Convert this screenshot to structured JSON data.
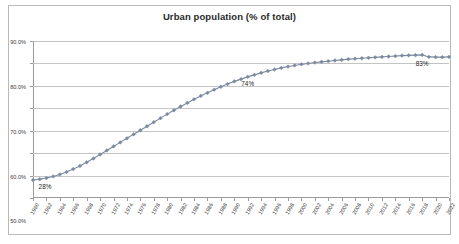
{
  "chart_data": {
    "type": "line",
    "title": "Urban population (% of total)",
    "xlabel": "",
    "ylabel": "",
    "ylim": [
      20,
      90
    ],
    "ytick_step": 10,
    "ytick_labels": [
      "20.0%",
      "30.0%",
      "40.0%",
      "50.0%",
      "60.0%",
      "70.0%",
      "80.0%",
      "90.0%"
    ],
    "ytick_values": [
      20,
      30,
      40,
      50,
      60,
      70,
      80,
      90
    ],
    "grid": "horizontal",
    "legend": "none",
    "marker": "diamond",
    "series_color": "#7b8aa0",
    "x": [
      1960,
      1961,
      1962,
      1963,
      1964,
      1965,
      1966,
      1967,
      1968,
      1969,
      1970,
      1971,
      1972,
      1973,
      1974,
      1975,
      1976,
      1977,
      1978,
      1979,
      1980,
      1981,
      1982,
      1983,
      1984,
      1985,
      1986,
      1987,
      1988,
      1989,
      1990,
      1991,
      1992,
      1993,
      1994,
      1995,
      1996,
      1997,
      1998,
      1999,
      2000,
      2001,
      2002,
      2003,
      2004,
      2005,
      2006,
      2007,
      2008,
      2009,
      2010,
      2011,
      2012,
      2013,
      2014,
      2015,
      2016,
      2017,
      2018,
      2019,
      2020,
      2021,
      2022
    ],
    "values": [
      28.0,
      28.4,
      28.9,
      29.6,
      30.5,
      31.6,
      32.9,
      34.3,
      35.9,
      37.6,
      39.4,
      41.2,
      43.0,
      44.8,
      46.6,
      48.4,
      50.2,
      52.0,
      53.8,
      55.6,
      57.4,
      59.1,
      60.8,
      62.4,
      64.0,
      65.5,
      66.9,
      68.3,
      69.6,
      70.8,
      72.0,
      73.0,
      74.0,
      74.9,
      75.8,
      76.6,
      77.3,
      78.0,
      78.6,
      79.1,
      79.6,
      80.0,
      80.4,
      80.7,
      81.0,
      81.3,
      81.6,
      81.9,
      82.1,
      82.3,
      82.5,
      82.7,
      82.9,
      83.1,
      83.3,
      83.5,
      83.6,
      83.7,
      83.8,
      82.9,
      82.8,
      82.8,
      82.9
    ],
    "xtick_labels": [
      "1960",
      "1962",
      "1964",
      "1966",
      "1968",
      "1970",
      "1972",
      "1974",
      "1976",
      "1978",
      "1980",
      "1982",
      "1984",
      "1986",
      "1988",
      "1990",
      "1992",
      "1994",
      "1996",
      "1998",
      "2000",
      "2002",
      "2004",
      "2006",
      "2008",
      "2010",
      "2012",
      "2014",
      "2016",
      "2018",
      "2020",
      "2022"
    ],
    "xtick_step": 2,
    "data_labels": [
      {
        "x": 1960,
        "value": 28,
        "text": "28%"
      },
      {
        "x": 1992,
        "value": 74,
        "text": "74%"
      },
      {
        "x": 2018,
        "value": 83,
        "text": "83%"
      }
    ]
  }
}
